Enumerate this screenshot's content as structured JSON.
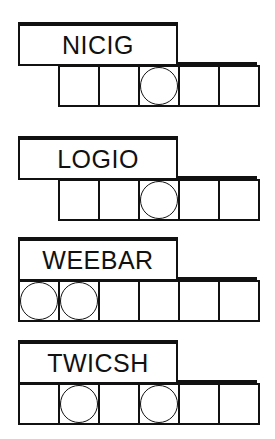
{
  "puzzles": [
    {
      "scrambled": "NICIG",
      "boxes": 5,
      "circled": [
        3
      ],
      "top": 22
    },
    {
      "scrambled": "LOGIO",
      "boxes": 5,
      "circled": [
        3
      ],
      "top": 136
    },
    {
      "scrambled": "WEEBAR",
      "boxes": 6,
      "circled": [
        1,
        2
      ],
      "top": 237
    },
    {
      "scrambled": "TWICSH",
      "boxes": 6,
      "circled": [
        2,
        4
      ],
      "top": 340
    }
  ]
}
